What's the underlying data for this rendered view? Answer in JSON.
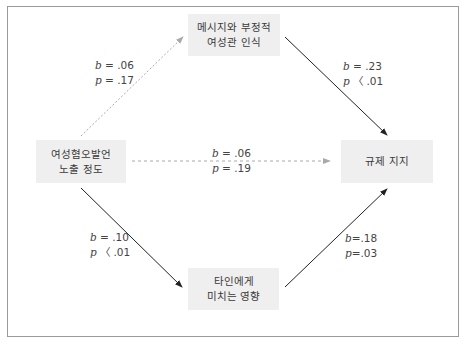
{
  "nodes": {
    "top": {
      "line1": "메시지와 부정적",
      "line2": "여성관 인식"
    },
    "left": {
      "line1": "여성혐오발언",
      "line2": "노출 정도"
    },
    "right": {
      "line1": "규제 지지"
    },
    "bottom": {
      "line1": "타인에게",
      "line2": "미치는 영향"
    }
  },
  "paths": {
    "left_top": {
      "b_sym": "b",
      "b_val": " = .06",
      "p_sym": "p",
      "p_val": " = .17",
      "style": "dashed"
    },
    "top_right": {
      "b_sym": "b",
      "b_val": " = .23",
      "p_sym": "p",
      "p_val": " 〈 .01",
      "style": "solid"
    },
    "left_right": {
      "b_sym": "b",
      "b_val": " = .06",
      "p_sym": "p",
      "p_val": " = .19",
      "style": "dashed"
    },
    "left_bottom": {
      "b_sym": "b",
      "b_val": " = .10",
      "p_sym": "p",
      "p_val": " 〈 .01",
      "style": "solid"
    },
    "bottom_right": {
      "b_sym": "b",
      "b_val": "=.18",
      "p_sym": "p",
      "p_val": "=.03",
      "style": "solid"
    }
  },
  "colors": {
    "node_bg": "#efefef",
    "solid_arrow": "#222222",
    "dashed_arrow": "#aaaaaa",
    "frame": "#9a9a9a"
  }
}
